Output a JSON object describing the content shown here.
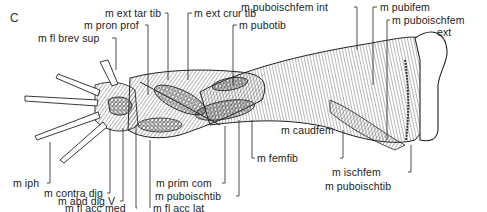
{
  "figure": {
    "panel_letter": "C",
    "ink_color": "#222222",
    "background": "#ffffff"
  },
  "labels": {
    "ext_tar_tib": "m ext tar tib",
    "ext_crur_tib": "m ext crur tib",
    "pron_prof": "m pron prof",
    "fl_brev_sup": "m fl brev sup",
    "pubotib": "m pubotib",
    "puboischfem_int": "m puboischfem int",
    "pubifem": "m pubifem",
    "puboischfem_ext_1": "m puboischfem",
    "puboischfem_ext_2": "ext",
    "caudfem": "m caudfem",
    "femfib": "m femfib",
    "ischfem": "m ischfem",
    "puboischtib_right": "m puboischtib",
    "iph": "m iph",
    "contra_dig": "m contra dig",
    "abd_dig_v": "m abd dig V",
    "fl_acc_med": "m fl acc med",
    "fl_acc_lat": "m fl acc lat",
    "prim_com": "m prim com",
    "puboischtib_left": "m puboischtib"
  }
}
